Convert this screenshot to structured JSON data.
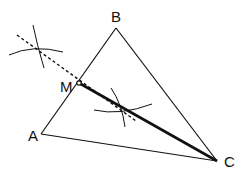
{
  "diagram": {
    "type": "geometry-construction",
    "points": {
      "A": {
        "label": "A",
        "x": 41,
        "y": 134
      },
      "B": {
        "label": "B",
        "x": 116,
        "y": 28
      },
      "C": {
        "label": "C",
        "x": 217,
        "y": 161
      },
      "M": {
        "label": "M",
        "x": 79,
        "y": 83
      }
    },
    "segments": [
      {
        "from": "A",
        "to": "B",
        "style": "thin"
      },
      {
        "from": "B",
        "to": "C",
        "style": "thin"
      },
      {
        "from": "A",
        "to": "C",
        "style": "thin"
      },
      {
        "from": "M",
        "to": "C",
        "style": "thick"
      }
    ],
    "construction_line": {
      "style": "dashed",
      "from": [
        17,
        35
      ],
      "to": [
        135,
        120
      ]
    },
    "arcs": [
      {
        "center": [
          35,
          48
        ],
        "note": "upper-left compass arc intersection"
      },
      {
        "center": [
          122,
          110
        ],
        "note": "lower-right compass arc intersection"
      }
    ],
    "colors": {
      "line": "#111111",
      "background": "#ffffff"
    }
  }
}
